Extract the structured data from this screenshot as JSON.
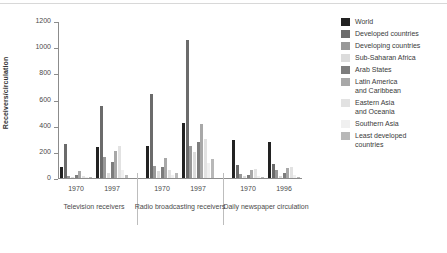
{
  "chart_data": {
    "type": "bar",
    "title": "",
    "subtitle": "",
    "xlabel": "",
    "ylabel": "Receivers/circulation",
    "ylim": [
      0,
      1200
    ],
    "yticks": [
      0,
      200,
      400,
      600,
      800,
      1000,
      1200
    ],
    "ytick_labels": [
      "0",
      "200",
      "400",
      "600",
      "800",
      "1000",
      "1200"
    ],
    "grid": false,
    "legend_position": "right",
    "legend": [
      "World",
      "Developed countries",
      "Developing countries",
      "Sub-Saharan Africa",
      "Arab States",
      "Latin America\nand Caribbean",
      "Eastern Asia\nand Oceania",
      "Southern Asia",
      "Least developed\ncountries"
    ],
    "series_colors": [
      "#222222",
      "#6b6b6b",
      "#989898",
      "#dcdcdc",
      "#7d7d7d",
      "#a8a8a8",
      "#e2e2e2",
      "#f0f0f0",
      "#b8b8b8"
    ],
    "groups": [
      {
        "label": "Television receivers",
        "subgroups": [
          {
            "label": "1970",
            "values": [
              81,
              263,
              19,
              9,
              25,
              57,
              15,
              5,
              6
            ]
          },
          {
            "label": "1997",
            "values": [
              240,
              548,
              157,
              42,
              119,
              205,
              248,
              61,
              23
            ]
          }
        ]
      },
      {
        "label": "Radio broadcasting\nreceivers",
        "subgroups": [
          {
            "label": "1970",
            "values": [
              243,
              643,
              92,
              52,
              87,
              156,
              63,
              22,
              37
            ]
          },
          {
            "label": "1997",
            "values": [
              418,
              1055,
              245,
              198,
              272,
              410,
              302,
              113,
              142
            ]
          }
        ]
      },
      {
        "label": "Daily newspaper\ncirculation",
        "subgroups": [
          {
            "label": "1970",
            "values": [
              289,
              101,
              29,
              12,
              22,
              60,
              70,
              15,
              8
            ]
          },
          {
            "label": "1996",
            "values": [
              273,
              107,
              60,
              12,
              38,
              74,
              88,
              25,
              10
            ]
          }
        ]
      }
    ]
  }
}
